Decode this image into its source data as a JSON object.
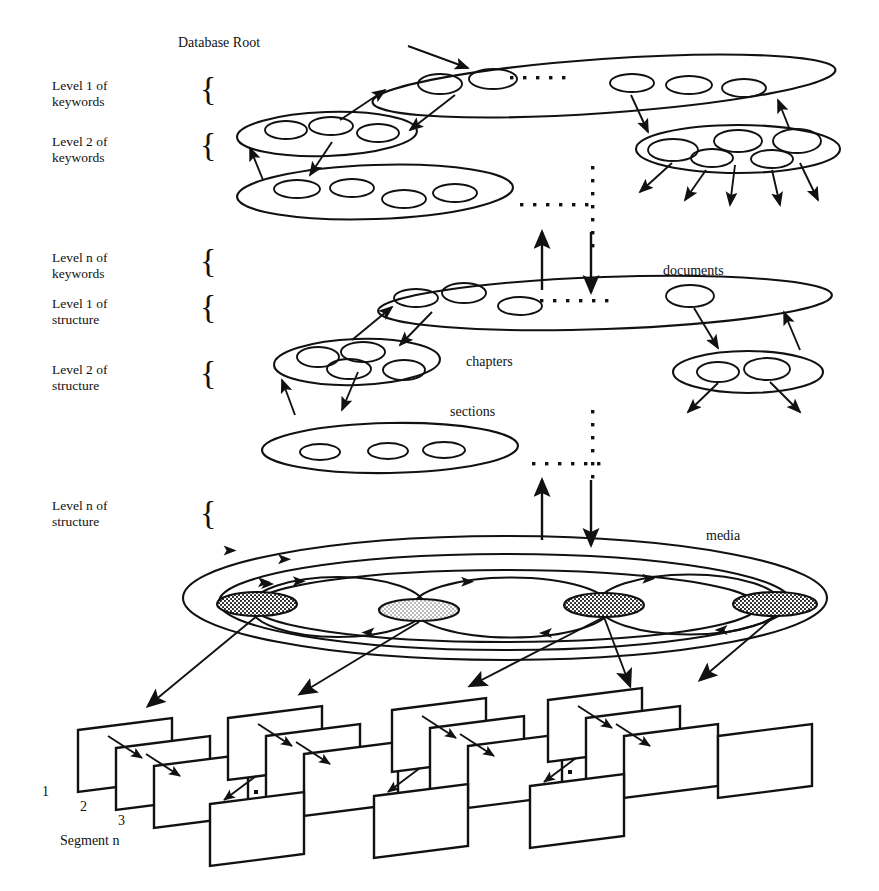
{
  "figure": {
    "title_label": "Database Root",
    "type": "hierarchical-multimedia-database-diagram",
    "background_color": "#ffffff",
    "ink_color": "#111111"
  },
  "level_labels": [
    {
      "id": "kw1",
      "line1": "Level 1 of",
      "line2": "keywords",
      "x": 52,
      "y": 78,
      "brace_x": 200,
      "brace_y": 72
    },
    {
      "id": "kw2",
      "line1": "Level 2 of",
      "line2": "keywords",
      "x": 52,
      "y": 134,
      "brace_x": 200,
      "brace_y": 128
    },
    {
      "id": "kwn",
      "line1": "Level n of",
      "line2": "keywords",
      "x": 52,
      "y": 250,
      "brace_x": 200,
      "brace_y": 244
    },
    {
      "id": "st1",
      "line1": "Level 1 of",
      "line2": "structure",
      "x": 52,
      "y": 296,
      "brace_x": 200,
      "brace_y": 290
    },
    {
      "id": "st2",
      "line1": "Level 2 of",
      "line2": "structure",
      "x": 52,
      "y": 362,
      "brace_x": 200,
      "brace_y": 356
    },
    {
      "id": "stn",
      "line1": "Level n of",
      "line2": "structure",
      "x": 52,
      "y": 498,
      "brace_x": 200,
      "brace_y": 496
    }
  ],
  "node_labels": [
    {
      "id": "documents",
      "text": "documents",
      "x": 663,
      "y": 262
    },
    {
      "id": "chapters",
      "text": "chapters",
      "x": 466,
      "y": 353
    },
    {
      "id": "sections",
      "text": "sections",
      "x": 450,
      "y": 403
    },
    {
      "id": "media",
      "text": "media",
      "x": 706,
      "y": 527
    }
  ],
  "segment_labels": [
    {
      "id": "seg1",
      "text": "1",
      "x": 42,
      "y": 783
    },
    {
      "id": "seg2",
      "text": "2",
      "x": 80,
      "y": 798
    },
    {
      "id": "seg3",
      "text": "3",
      "x": 118,
      "y": 812
    },
    {
      "id": "segn",
      "text": "Segment n",
      "x": 60,
      "y": 832
    }
  ],
  "ellipsis_groups": [
    {
      "id": "root-dots-h",
      "orientation": "horizontal",
      "x": 510,
      "y": 76,
      "count": 5
    },
    {
      "id": "kw2-dots-h",
      "orientation": "horizontal",
      "x": 520,
      "y": 203,
      "count": 6
    },
    {
      "id": "kw-to-struct-dots",
      "orientation": "vertical",
      "x": 591,
      "y": 166,
      "count": 7
    },
    {
      "id": "docs-dots-h",
      "orientation": "horizontal",
      "x": 540,
      "y": 299,
      "count": 6
    },
    {
      "id": "sections-dots-h",
      "orientation": "horizontal",
      "x": 532,
      "y": 462,
      "count": 6
    },
    {
      "id": "struct-to-media-dots",
      "orientation": "vertical",
      "x": 591,
      "y": 410,
      "count": 6
    }
  ],
  "layers": [
    {
      "id": "database-root",
      "name": "database-root-ellipse",
      "cx": 604,
      "cy": 86,
      "rx": 232,
      "ry": 27,
      "rot": -4,
      "children": [
        {
          "cx": 440,
          "cy": 84,
          "rx": 22,
          "ry": 10
        },
        {
          "cx": 493,
          "cy": 79,
          "rx": 24,
          "ry": 10
        },
        {
          "cx": 632,
          "cy": 83,
          "rx": 22,
          "ry": 9
        },
        {
          "cx": 689,
          "cy": 85,
          "rx": 23,
          "ry": 9
        },
        {
          "cx": 744,
          "cy": 88,
          "rx": 22,
          "ry": 9
        }
      ]
    },
    {
      "id": "keyword-level2-left",
      "name": "keyword-level2-left-ellipse",
      "cx": 327,
      "cy": 134,
      "rx": 90,
      "ry": 22,
      "rot": -2,
      "children": [
        {
          "cx": 286,
          "cy": 130,
          "rx": 21,
          "ry": 9
        },
        {
          "cx": 331,
          "cy": 126,
          "rx": 22,
          "ry": 9
        },
        {
          "cx": 378,
          "cy": 133,
          "rx": 21,
          "ry": 9
        }
      ]
    },
    {
      "id": "keyword-level2-right",
      "name": "keyword-level2-right-ellipse",
      "cx": 738,
      "cy": 149,
      "rx": 102,
      "ry": 24,
      "rot": 0,
      "children": [
        {
          "cx": 673,
          "cy": 150,
          "rx": 25,
          "ry": 11
        },
        {
          "cx": 712,
          "cy": 158,
          "rx": 21,
          "ry": 9
        },
        {
          "cx": 738,
          "cy": 141,
          "rx": 24,
          "ry": 11
        },
        {
          "cx": 772,
          "cy": 159,
          "rx": 21,
          "ry": 9
        },
        {
          "cx": 797,
          "cy": 141,
          "rx": 24,
          "ry": 12
        }
      ]
    },
    {
      "id": "keyword-level-n",
      "name": "keyword-level-n-ellipse",
      "cx": 375,
      "cy": 192,
      "rx": 138,
      "ry": 27,
      "rot": -2,
      "children": [
        {
          "cx": 297,
          "cy": 189,
          "rx": 23,
          "ry": 9
        },
        {
          "cx": 352,
          "cy": 188,
          "rx": 22,
          "ry": 9
        },
        {
          "cx": 404,
          "cy": 199,
          "rx": 22,
          "ry": 9
        },
        {
          "cx": 455,
          "cy": 193,
          "rx": 22,
          "ry": 9
        }
      ]
    },
    {
      "id": "documents-layer",
      "name": "documents-ellipse",
      "cx": 605,
      "cy": 303,
      "rx": 227,
      "ry": 26,
      "rot": -2,
      "children": [
        {
          "cx": 416,
          "cy": 298,
          "rx": 22,
          "ry": 9
        },
        {
          "cx": 464,
          "cy": 293,
          "rx": 22,
          "ry": 10
        },
        {
          "cx": 520,
          "cy": 306,
          "rx": 22,
          "ry": 9
        },
        {
          "cx": 690,
          "cy": 296,
          "rx": 24,
          "ry": 11
        }
      ]
    },
    {
      "id": "chapters-layer-left",
      "name": "chapters-ellipse",
      "cx": 357,
      "cy": 362,
      "rx": 83,
      "ry": 23,
      "rot": -2,
      "children": [
        {
          "cx": 318,
          "cy": 357,
          "rx": 21,
          "ry": 10
        },
        {
          "cx": 363,
          "cy": 352,
          "rx": 22,
          "ry": 10
        },
        {
          "cx": 349,
          "cy": 369,
          "rx": 22,
          "ry": 10
        },
        {
          "cx": 404,
          "cy": 370,
          "rx": 21,
          "ry": 10
        }
      ]
    },
    {
      "id": "chapters-layer-right",
      "name": "chapters-right-ellipse",
      "cx": 748,
      "cy": 372,
      "rx": 75,
      "ry": 21,
      "rot": 0,
      "children": [
        {
          "cx": 718,
          "cy": 372,
          "rx": 21,
          "ry": 10
        },
        {
          "cx": 767,
          "cy": 369,
          "rx": 23,
          "ry": 11
        }
      ]
    },
    {
      "id": "sections-layer",
      "name": "sections-ellipse",
      "cx": 390,
      "cy": 448,
      "rx": 128,
      "ry": 25,
      "rot": -1,
      "children": [
        {
          "cx": 320,
          "cy": 452,
          "rx": 20,
          "ry": 8
        },
        {
          "cx": 388,
          "cy": 451,
          "rx": 20,
          "ry": 8
        },
        {
          "cx": 444,
          "cy": 450,
          "rx": 21,
          "ry": 8
        }
      ]
    }
  ],
  "media_ring": {
    "id": "media-ring",
    "cx": 505,
    "cy": 598,
    "outer_rx": 322,
    "outer_ry": 62,
    "mid_rx": 286,
    "mid_ry": 48,
    "inner_rx": 252,
    "inner_ry": 36,
    "nodes": [
      {
        "id": "media-node-1",
        "cx": 257,
        "cy": 604,
        "rx": 40,
        "ry": 12,
        "fill": "dark-stipple"
      },
      {
        "id": "media-node-2",
        "cx": 419,
        "cy": 610,
        "rx": 40,
        "ry": 11,
        "fill": "light-stipple"
      },
      {
        "id": "media-node-3",
        "cx": 604,
        "cy": 605,
        "rx": 40,
        "ry": 12,
        "fill": "dark-stipple"
      },
      {
        "id": "media-node-4",
        "cx": 775,
        "cy": 604,
        "rx": 42,
        "ry": 12,
        "fill": "dark-stipple"
      }
    ]
  },
  "segment_groups": [
    {
      "id": "segment-group-1",
      "x": 78,
      "y": 730,
      "cards": 3,
      "trailing_dot": true,
      "lower_card": false
    },
    {
      "id": "segment-group-2",
      "x": 228,
      "y": 718,
      "cards": 3,
      "trailing_dot": false,
      "lower_card": true
    },
    {
      "id": "segment-group-3",
      "x": 392,
      "y": 710,
      "cards": 3,
      "trailing_dot": true,
      "lower_card": true
    },
    {
      "id": "segment-group-4",
      "x": 548,
      "y": 700,
      "cards": 3,
      "trailing_dot": true,
      "lower_card": true
    },
    {
      "id": "segment-group-5",
      "x": 718,
      "y": 736,
      "cards": 1,
      "trailing_dot": false,
      "lower_card": false
    }
  ],
  "connectors": {
    "root_inbound": {
      "from_x": 408,
      "from_y": 46,
      "to_x": 468,
      "to_y": 68
    },
    "vertical_pairs": [
      {
        "id": "kw-to-struct",
        "up_x": 542,
        "up_top_y": 232,
        "up_bottom_y": 290,
        "down_x": 591,
        "down_top_y": 232,
        "down_bottom_y": 292
      },
      {
        "id": "struct-to-media",
        "up_x": 542,
        "up_top_y": 480,
        "up_bottom_y": 540,
        "down_x": 591,
        "down_top_y": 480,
        "down_bottom_y": 545
      }
    ]
  }
}
